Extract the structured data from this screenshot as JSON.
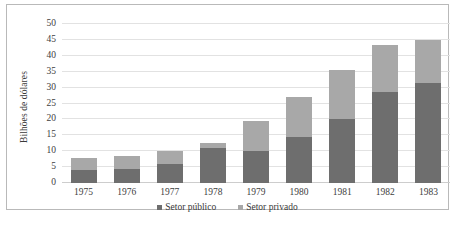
{
  "axis": {
    "y_title": "Bilhões de dólares",
    "y_ticks": [
      "50",
      "45",
      "40",
      "35",
      "30",
      "25",
      "20",
      "15",
      "10",
      "5",
      "0"
    ],
    "x_ticks": [
      "1975",
      "1976",
      "1977",
      "1978",
      "1979",
      "1980",
      "1981",
      "1982",
      "1983"
    ]
  },
  "legend": {
    "items": [
      {
        "label": "Setor público",
        "swatch": "legend-swatch-public",
        "color": "#6e6e6e"
      },
      {
        "label": "Setor privado",
        "swatch": "legend-swatch-private",
        "color": "#a8a8a8"
      }
    ]
  },
  "caption": {
    "text": ""
  },
  "chart_data": {
    "type": "bar",
    "title": "",
    "subtitle": "",
    "xlabel": "",
    "ylabel": "Bilhões de dólares",
    "ylim": [
      0,
      50
    ],
    "ytick_step": 5,
    "grid": true,
    "stacked": true,
    "legend_position": "bottom-center",
    "categories": [
      "1975",
      "1976",
      "1977",
      "1978",
      "1979",
      "1980",
      "1981",
      "1982",
      "1983"
    ],
    "series": [
      {
        "name": "Setor público",
        "color": "#6e6e6e",
        "values": [
          4,
          4.5,
          6,
          11,
          10,
          14.5,
          20,
          28.5,
          31.5
        ]
      },
      {
        "name": "Setor privado",
        "color": "#a8a8a8",
        "values": [
          4,
          4,
          4,
          1.5,
          9.5,
          12.5,
          15.5,
          15,
          13.5
        ]
      }
    ],
    "totals": [
      8,
      8.5,
      10,
      12.5,
      19.5,
      27,
      35.5,
      43.5,
      45
    ]
  }
}
